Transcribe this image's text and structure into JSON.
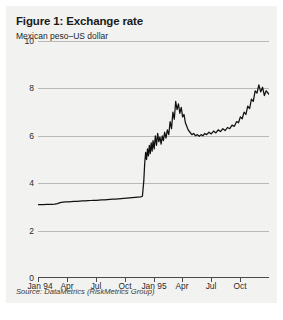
{
  "figure": {
    "title": "Figure 1: Exchange rate",
    "subtitle": "Mexican peso–US dollar",
    "source": "Source: DataMetrics (RiskMetrics Group)"
  },
  "colors": {
    "panel_background": "#f2f2f0",
    "series_line": "#111111",
    "gridline": "#b9b9b9",
    "axis": "#4a4a4a",
    "text": "#1a1a1a"
  },
  "chart_data": {
    "type": "line",
    "title": "Figure 1: Exchange rate",
    "subtitle": "Mexican peso–US dollar",
    "xlabel": "",
    "ylabel": "",
    "ylim": [
      0,
      10
    ],
    "ytick_labels": [
      "10",
      "8",
      "6",
      "4",
      "2",
      "0"
    ],
    "ytick_values": [
      10,
      8,
      6,
      4,
      2,
      0
    ],
    "xtick_labels": [
      "Jan 94",
      "Apr",
      "Jul",
      "Oct",
      "Jan 95",
      "Apr",
      "Jul",
      "Oct"
    ],
    "xtick_positions": [
      0,
      0.125,
      0.25,
      0.375,
      0.5,
      0.625,
      0.75,
      0.875
    ],
    "grid": true,
    "legend": false,
    "series": [
      {
        "name": "Mexican peso–US dollar",
        "x": [
          0.0,
          0.012,
          0.024,
          0.036,
          0.048,
          0.06,
          0.072,
          0.084,
          0.096,
          0.108,
          0.12,
          0.132,
          0.144,
          0.156,
          0.168,
          0.18,
          0.192,
          0.204,
          0.216,
          0.228,
          0.24,
          0.252,
          0.264,
          0.276,
          0.288,
          0.3,
          0.312,
          0.324,
          0.336,
          0.348,
          0.36,
          0.372,
          0.384,
          0.396,
          0.408,
          0.42,
          0.432,
          0.444,
          0.452,
          0.458,
          0.462,
          0.466,
          0.47,
          0.474,
          0.478,
          0.482,
          0.486,
          0.49,
          0.494,
          0.498,
          0.503,
          0.508,
          0.513,
          0.518,
          0.523,
          0.528,
          0.533,
          0.538,
          0.543,
          0.548,
          0.554,
          0.56,
          0.566,
          0.572,
          0.578,
          0.584,
          0.59,
          0.596,
          0.602,
          0.608,
          0.614,
          0.62,
          0.626,
          0.632,
          0.638,
          0.644,
          0.65,
          0.658,
          0.666,
          0.674,
          0.682,
          0.69,
          0.698,
          0.706,
          0.714,
          0.722,
          0.73,
          0.74,
          0.75,
          0.76,
          0.77,
          0.78,
          0.79,
          0.8,
          0.81,
          0.82,
          0.83,
          0.84,
          0.85,
          0.86,
          0.868,
          0.876,
          0.884,
          0.892,
          0.9,
          0.908,
          0.916,
          0.924,
          0.932,
          0.94,
          0.948,
          0.956,
          0.964,
          0.972,
          0.98,
          0.988,
          1.0
        ],
        "y": [
          3.1,
          3.1,
          3.1,
          3.11,
          3.11,
          3.11,
          3.12,
          3.14,
          3.18,
          3.2,
          3.21,
          3.21,
          3.22,
          3.23,
          3.23,
          3.24,
          3.25,
          3.25,
          3.26,
          3.27,
          3.28,
          3.28,
          3.29,
          3.3,
          3.3,
          3.31,
          3.32,
          3.33,
          3.33,
          3.34,
          3.35,
          3.36,
          3.37,
          3.38,
          3.39,
          3.4,
          3.41,
          3.42,
          3.45,
          4.1,
          4.85,
          5.3,
          5.0,
          5.45,
          5.15,
          5.6,
          5.25,
          5.7,
          5.35,
          5.8,
          5.45,
          6.0,
          5.6,
          6.1,
          5.75,
          5.95,
          5.65,
          6.0,
          5.8,
          6.15,
          5.9,
          6.25,
          6.05,
          6.6,
          6.3,
          7.0,
          6.7,
          7.45,
          7.1,
          7.35,
          6.95,
          7.2,
          6.8,
          6.9,
          6.55,
          6.4,
          6.25,
          6.15,
          6.05,
          6.1,
          6.0,
          6.05,
          5.98,
          6.05,
          6.0,
          6.1,
          6.05,
          6.15,
          6.08,
          6.2,
          6.12,
          6.25,
          6.18,
          6.3,
          6.22,
          6.35,
          6.3,
          6.45,
          6.4,
          6.6,
          6.55,
          6.8,
          6.72,
          7.0,
          6.9,
          7.25,
          7.15,
          7.55,
          7.45,
          7.9,
          7.8,
          8.15,
          7.85,
          8.05,
          7.7,
          7.9,
          7.75
        ]
      }
    ],
    "annotations": [
      {
        "label": "December 1994 peso devaluation",
        "x": 0.455,
        "y_from": 3.45,
        "y_to": 5.3
      }
    ]
  }
}
